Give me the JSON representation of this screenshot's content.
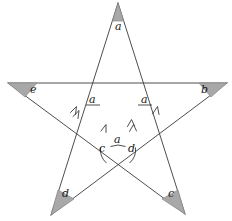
{
  "figure": {
    "kind": "geometry-diagram",
    "shape": "five-pointed-star",
    "width": 232,
    "height": 221,
    "background": "#ffffff",
    "stroke_color": "#3a3a3a",
    "shade_color": "#a8a8a8",
    "shade_stroke": "#8a8a8a",
    "label_color": "#1a1a1a"
  },
  "vertex_labels": {
    "top": "a",
    "right": "b",
    "left": "e",
    "bottom_left": "d",
    "bottom_right": "c"
  },
  "interior_labels": {
    "left_upper": "a",
    "right_upper": "a",
    "center_left": "c",
    "center_top": "a",
    "center_right": "d"
  },
  "markers": {
    "single_arrow": "single-chevron-parallel-mark",
    "double_arrow": "double-chevron-parallel-mark"
  },
  "geometry": {
    "apex_top": [
      118,
      3
    ],
    "apex_left": [
      8,
      83
    ],
    "apex_right": [
      227,
      83
    ],
    "apex_bottom_left": [
      51,
      215
    ],
    "apex_bottom_right": [
      185,
      214
    ],
    "inner_top_left": [
      93,
      83
    ],
    "inner_top_right": [
      145,
      83
    ],
    "inner_left": [
      75,
      134
    ],
    "inner_right": [
      162,
      134
    ],
    "inner_bottom": [
      118,
      165
    ]
  }
}
